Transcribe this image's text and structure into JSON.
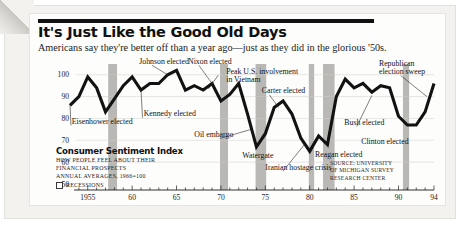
{
  "header": {
    "title": "It's Just Like the Good Old Days",
    "deck": "Americans say they're better off than a year ago—just as they did in the glorious '50s."
  },
  "legend": {
    "title": "Consumer Sentiment Index",
    "sub1": "HOW PEOPLE FEEL ABOUT THEIR",
    "sub2": "FINANCIAL PROSPECTS",
    "sub3": "ANNUAL AVERAGES, 1966=100",
    "recessions_label": "RECESSIONS"
  },
  "source": {
    "line1": "SOURCE: UNIVERSITY",
    "line2": "OF MICHIGAN SURVEY",
    "line3": "RESEARCH CENTER"
  },
  "chart_data": {
    "type": "line",
    "title": "Consumer Sentiment Index",
    "subtitle": "How people feel about their financial prospects",
    "xlabel": "",
    "ylabel": "",
    "xlim": [
      1953,
      1994
    ],
    "ylim": [
      50,
      104
    ],
    "yticks": [
      50,
      60,
      70,
      80,
      90,
      100
    ],
    "ytick_labels": [
      "50",
      "60",
      "70",
      "80",
      "90",
      "100"
    ],
    "xticks": [
      1955,
      1960,
      1965,
      1970,
      1975,
      1980,
      1985,
      1990,
      1994
    ],
    "xtick_labels": [
      "1955",
      "60",
      "65",
      "70",
      "75",
      "80",
      "85",
      "90",
      "94"
    ],
    "grid": "horizontal",
    "legend_position": "inside-lower-left",
    "series": [
      {
        "name": "Consumer Sentiment Index",
        "color": "#121212",
        "x": [
          1953,
          1954,
          1955,
          1956,
          1957,
          1958,
          1959,
          1960,
          1961,
          1962,
          1963,
          1964,
          1965,
          1966,
          1967,
          1968,
          1969,
          1970,
          1971,
          1972,
          1973,
          1974,
          1975,
          1976,
          1977,
          1978,
          1979,
          1980,
          1981,
          1982,
          1983,
          1984,
          1985,
          1986,
          1987,
          1988,
          1989,
          1990,
          1991,
          1992,
          1993,
          1994
        ],
        "values": [
          86,
          90,
          99,
          94,
          83,
          89,
          95,
          99,
          93,
          96,
          96,
          100,
          102,
          93,
          95,
          93,
          96,
          88,
          91,
          96,
          82,
          67,
          73,
          85,
          88,
          82,
          71,
          65,
          72,
          68,
          90,
          98,
          94,
          96,
          92,
          95,
          94,
          81,
          77,
          77,
          83,
          96
        ]
      }
    ],
    "recessions": [
      {
        "start": 1957.3,
        "end": 1958.3
      },
      {
        "start": 1969.9,
        "end": 1970.8
      },
      {
        "start": 1973.9,
        "end": 1975.1
      },
      {
        "start": 1979.9,
        "end": 1980.5
      },
      {
        "start": 1981.5,
        "end": 1982.8
      },
      {
        "start": 1990.5,
        "end": 1991.2
      }
    ],
    "annotations": [
      {
        "text": "Eisenhower elected",
        "label_x": 1953.2,
        "label_y": 77.5,
        "point_x": 1953.0,
        "point_y": 86.0
      },
      {
        "text": "Johnson elected",
        "label_x": 1960.8,
        "label_y": 105.0,
        "point_x": 1964.0,
        "point_y": 100.0
      },
      {
        "text": "Kennedy elected",
        "label_x": 1961.3,
        "label_y": 81.0,
        "point_x": 1961.0,
        "point_y": 93.0
      },
      {
        "text": "Nixon elected",
        "label_x": 1966.3,
        "label_y": 105.0,
        "point_x": 1969.0,
        "point_y": 96.0
      },
      {
        "text": "Peak U.S. involvement",
        "label_x": 1970.6,
        "label_y": 100.5,
        "point_x": 1968.6,
        "point_y": 93.5
      },
      {
        "text": "in Vietnam",
        "label_x": 1970.6,
        "label_y": 96.9,
        "point_x": null,
        "point_y": null
      },
      {
        "text": "Oil embargo",
        "label_x": 1967.0,
        "label_y": 71.5,
        "point_x": 1973.4,
        "point_y": 75.0
      },
      {
        "text": "Carter elected",
        "label_x": 1974.6,
        "label_y": 91.5,
        "point_x": 1976.5,
        "point_y": 85.0
      },
      {
        "text": "Watergate",
        "label_x": 1972.4,
        "label_y": 62.0,
        "point_x": null,
        "point_y": null
      },
      {
        "text": "Iranian hostage crisis",
        "label_x": 1975.0,
        "label_y": 56.5,
        "point_x": 1979.4,
        "point_y": 68.0
      },
      {
        "text": "Reagan elected",
        "label_x": 1980.6,
        "label_y": 62.5,
        "point_x": null,
        "point_y": null
      },
      {
        "text": "Bush elected",
        "label_x": 1983.9,
        "label_y": 77.0,
        "point_x": 1987.0,
        "point_y": 90.5
      },
      {
        "text": "Clinton elected",
        "label_x": 1985.8,
        "label_y": 68.5,
        "point_x": null,
        "point_y": null
      },
      {
        "text": "Republican",
        "label_x": 1987.8,
        "label_y": 104.0,
        "point_x": null,
        "point_y": null
      },
      {
        "text": "election sweep",
        "label_x": 1987.8,
        "label_y": 100.4,
        "point_x": 1993.2,
        "point_y": 90.0
      }
    ]
  }
}
